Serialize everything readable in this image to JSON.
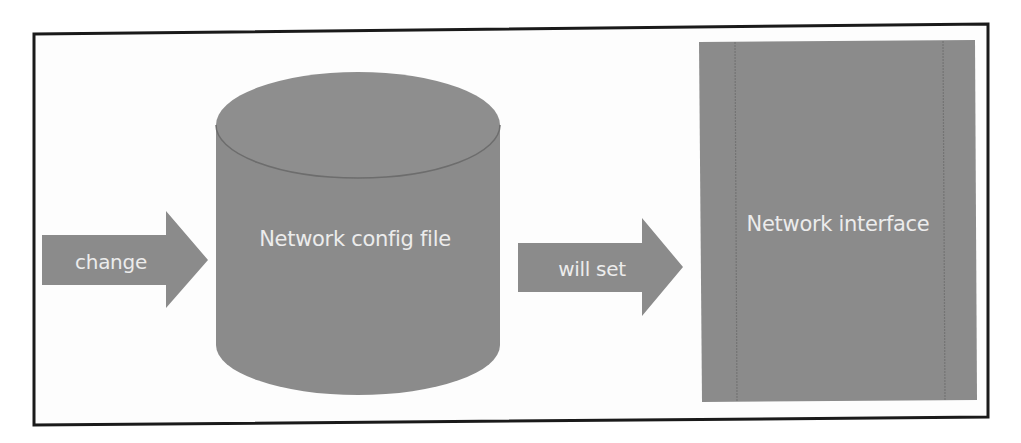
{
  "diagram": {
    "frame": {
      "border_color": "#1a1a1a",
      "background": "#fdfdfd"
    },
    "colors": {
      "shape_fill": "#8b8b8b",
      "shape_edge": "#6d6d6d",
      "text": "#ececec"
    },
    "nodes": [
      {
        "id": "change_arrow",
        "shape": "block-arrow",
        "label": "change"
      },
      {
        "id": "config_file",
        "shape": "cylinder",
        "label": "Network config file"
      },
      {
        "id": "willset_arrow",
        "shape": "block-arrow",
        "label": "will set"
      },
      {
        "id": "interface",
        "shape": "rectangle",
        "label": "Network interface"
      }
    ],
    "edges": [
      {
        "from": "change_arrow",
        "to": "config_file",
        "label": "change"
      },
      {
        "from": "config_file",
        "to": "interface",
        "label": "will set"
      }
    ]
  }
}
